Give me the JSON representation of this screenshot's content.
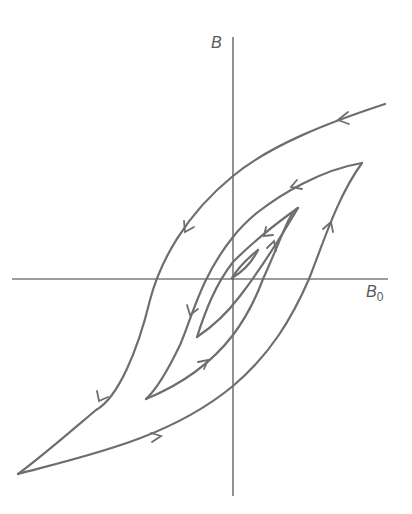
{
  "figure": {
    "type": "hysteresis-loops",
    "axes": {
      "y_label": "B",
      "x_label_main": "B",
      "x_label_sub": "0"
    },
    "colors": {
      "curve": "#6e6e6e",
      "axis": "#3a3a3a",
      "label": "#5a5a5a"
    },
    "loop_count": 4,
    "loops": [
      {
        "name": "outer",
        "direction": "counter-clockwise traversal: upper branch right-to-left, lower branch left-to-right"
      },
      {
        "name": "second"
      },
      {
        "name": "third"
      },
      {
        "name": "innermost"
      }
    ]
  }
}
